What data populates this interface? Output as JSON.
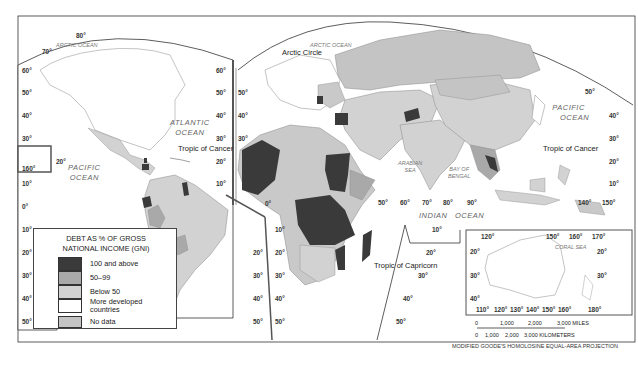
{
  "map": {
    "projection_note": "MODIFIED GOODE'S HOMOLOSINE EQUAL-AREA PROJECTION",
    "legend": {
      "title_line1": "DEBT AS % OF GROSS",
      "title_line2": "NATIONAL INCOME (GNI)",
      "items": [
        {
          "label": "100 and above",
          "color": "#3a3a3a"
        },
        {
          "label": "50–99",
          "color": "#a9a9a9"
        },
        {
          "label": "Below 50",
          "color": "#d2d2d2"
        },
        {
          "label_line1": "More developed",
          "label_line2": "countries",
          "color": "#ffffff"
        },
        {
          "label": "No data",
          "color": "#c4c4c4"
        }
      ]
    },
    "oceans": {
      "arctic_left": "ARCTIC OCEAN",
      "arctic_right": "ARCTIC OCEAN",
      "atlantic_1": "ATLANTIC",
      "atlantic_2": "OCEAN",
      "pacific_left_1": "PACIFIC",
      "pacific_left_2": "OCEAN",
      "pacific_right_1": "PACIFIC",
      "pacific_right_2": "OCEAN",
      "indian_1": "INDIAN",
      "indian_2": "OCEAN",
      "arabian_1": "ARABIAN",
      "arabian_2": "SEA",
      "bengal_1": "BAY OF",
      "bengal_2": "BENGAL",
      "coral": "CORAL SEA"
    },
    "lines": {
      "arctic_circle": "Arctic Circle",
      "cancer_left": "Tropic of Cancer",
      "cancer_right": "Tropic of Cancer",
      "capricorn": "Tropic of Capricorn"
    },
    "latitudes_left": [
      "60°",
      "50°",
      "40°",
      "30°",
      "20°",
      "10°",
      "0°",
      "10°",
      "20°",
      "30°",
      "40°",
      "50°"
    ],
    "latitudes_mid_left": [
      "60°",
      "50°",
      "40°",
      "30°",
      "20°",
      "10°",
      "10°",
      "20°",
      "30°",
      "40°",
      "50°"
    ],
    "latitudes_mid_right": [
      "50°",
      "40°",
      "30°",
      "10°",
      "20°",
      "30°",
      "40°",
      "50°"
    ],
    "latitudes_right": [
      "50°",
      "40°",
      "30°",
      "20°",
      "10°"
    ],
    "top_labels": {
      "lat80": "80°",
      "lat70": "70°",
      "lon160": "160°",
      "lat20_pac": "20°",
      "zero_a": "0°",
      "zero_b": "0°"
    },
    "longitudes_indian": [
      "50°",
      "60°",
      "70°",
      "80°",
      "90°"
    ],
    "indian_lats": [
      "10°",
      "20°",
      "30°",
      "40°",
      "50°"
    ],
    "pacific_lons": [
      "140°",
      "150°"
    ],
    "australia_inset": {
      "top_lons": [
        "120°",
        "150°",
        "160°",
        "170°"
      ],
      "bottom_lons": [
        "110°",
        "120°",
        "130°",
        "140°",
        "150°",
        "160°",
        "180°"
      ],
      "left_lats": [
        "20°",
        "30°",
        "40°"
      ],
      "right_lats": [
        "20°",
        "30°"
      ]
    },
    "scale": {
      "miles": [
        "0",
        "1,000",
        "2,000",
        "3,000 MILES"
      ],
      "km": [
        "0",
        "1,000",
        "2,000",
        "3,000 KILOMETERS"
      ]
    }
  }
}
